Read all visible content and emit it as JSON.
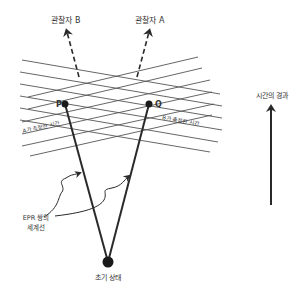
{
  "diagram": {
    "observer_b_label": "관찰자 B",
    "observer_a_label": "관찰자 A",
    "event_p_label": "P",
    "event_q_label": "Q",
    "a_time_label": "A가 측정한 시간",
    "b_time_label": "B가 측정한 시간",
    "worldline_label_line1": "EPR 쌍의",
    "worldline_label_line2": "세계선",
    "initial_state_label": "초기 상태",
    "time_flow_label": "시간의 경과"
  },
  "colors": {
    "line": "#2a2a2a",
    "grid": "#555555",
    "text": "#333333"
  }
}
